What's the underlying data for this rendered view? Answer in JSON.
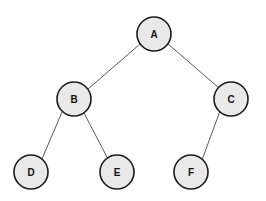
{
  "diagram": {
    "type": "binary-tree",
    "background_color": "#ffffff",
    "node_fill_color": "#e9e9e9",
    "node_stroke_color": "#1c1c1c",
    "edge_color": "#5a5a5a",
    "node_radius": 17,
    "nodes": [
      {
        "id": "A",
        "label": "A",
        "cx": 154,
        "cy": 34,
        "level": 0
      },
      {
        "id": "B",
        "label": "B",
        "cx": 74,
        "cy": 99,
        "level": 1
      },
      {
        "id": "C",
        "label": "C",
        "cx": 231,
        "cy": 99,
        "level": 1
      },
      {
        "id": "D",
        "label": "D",
        "cx": 31,
        "cy": 172,
        "level": 2
      },
      {
        "id": "E",
        "label": "E",
        "cx": 117,
        "cy": 172,
        "level": 2
      },
      {
        "id": "F",
        "label": "F",
        "cx": 191,
        "cy": 172,
        "level": 2
      }
    ],
    "edges": [
      {
        "id": "A-B",
        "from": "A",
        "to": "B",
        "x1": 140,
        "y1": 44,
        "x2": 88,
        "y2": 89
      },
      {
        "id": "A-C",
        "from": "A",
        "to": "C",
        "x1": 168,
        "y1": 44,
        "x2": 219,
        "y2": 88
      },
      {
        "id": "B-D",
        "from": "B",
        "to": "D",
        "x1": 62,
        "y1": 112,
        "x2": 42,
        "y2": 159
      },
      {
        "id": "B-E",
        "from": "B",
        "to": "E",
        "x1": 84,
        "y1": 113,
        "x2": 108,
        "y2": 159
      },
      {
        "id": "C-F",
        "from": "C",
        "to": "F",
        "x1": 220,
        "y1": 111,
        "x2": 202,
        "y2": 160
      }
    ]
  }
}
